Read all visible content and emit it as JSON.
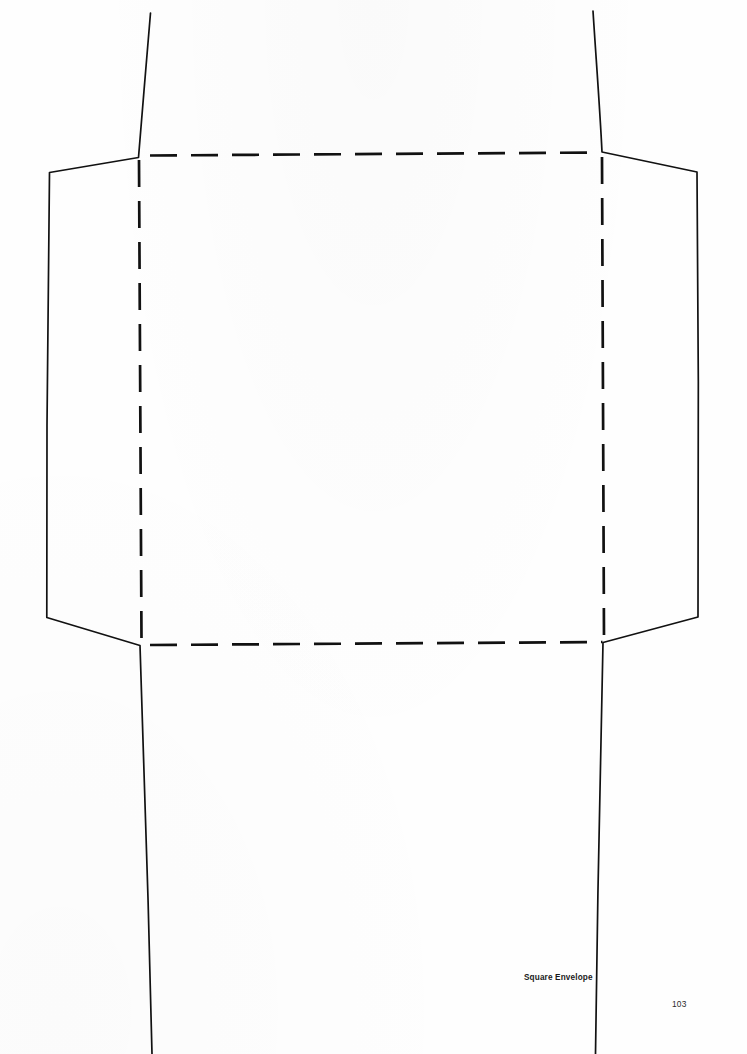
{
  "page": {
    "kind": "craft-template-diagram",
    "background_color": "#fefefe",
    "width": 747,
    "height": 1054
  },
  "caption": {
    "label": "Square Envelope"
  },
  "footer": {
    "page_number": "103"
  },
  "diagram": {
    "title": "Square Envelope",
    "stroke_color": "#111111",
    "cut_line_style": "solid",
    "fold_line_style": "dashed",
    "cut_line_width": 1.6,
    "fold_line_width": 2.6,
    "fold_dash_pattern": "27 15",
    "fold_square": {
      "top_y": 155,
      "bottom_y": 643,
      "left_x": 140,
      "right_x": 603
    },
    "cut_outline_points": "150,13 138,157 49,173 46,617 140,645 152,1054",
    "cut_outline_points_right": "593,11 602,152 697,172 698,617 603,643 595,1054",
    "fold_top": "151,155 601,152",
    "fold_bottom": "150,645 602,642",
    "fold_left": "139,160 141,641",
    "fold_right": "602,157 604,640",
    "flaps": [
      {
        "name": "top-flap",
        "type": "cut-edge"
      },
      {
        "name": "bottom-flap",
        "type": "cut-edge"
      },
      {
        "name": "left-side-flap",
        "type": "cut-edge"
      },
      {
        "name": "right-side-flap",
        "type": "cut-edge"
      }
    ]
  }
}
